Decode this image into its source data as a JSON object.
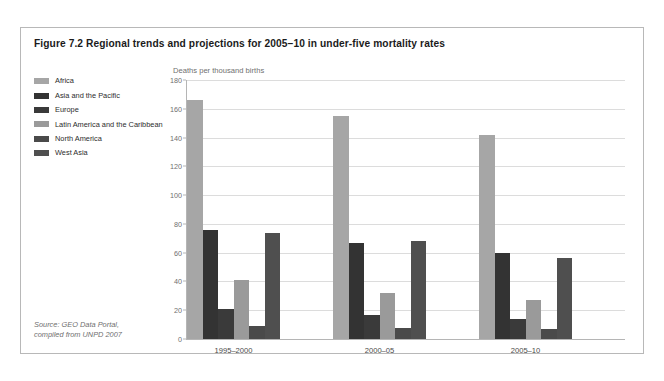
{
  "figure": {
    "title": "Figure 7.2 Regional trends and projections for 2005–10 in under-five mortality rates",
    "source_note": "Source: GEO Data Portal,\ncompiled from UNPD 2007"
  },
  "legend": {
    "items": [
      {
        "label": "Africa",
        "color": "#a6a6a6"
      },
      {
        "label": "Asia and the Pacific",
        "color": "#333333"
      },
      {
        "label": "Europe",
        "color": "#3a3a3a"
      },
      {
        "label": "Latin America and the Caribbean",
        "color": "#9a9a9a"
      },
      {
        "label": "North America",
        "color": "#4a4a4a"
      },
      {
        "label": "West Asia",
        "color": "#4f4f4f"
      }
    ]
  },
  "chart_data": {
    "type": "bar",
    "title": "Figure 7.2 Regional trends and projections for 2005–10 in under-five mortality rates",
    "xlabel": "",
    "ylabel": "Deaths per thousand births",
    "ylim": [
      0,
      180
    ],
    "yticks": [
      0,
      20,
      40,
      60,
      80,
      100,
      120,
      140,
      160,
      180
    ],
    "grid": true,
    "legend_position": "left",
    "categories": [
      "1995–2000",
      "2000–05",
      "2005–10"
    ],
    "series": [
      {
        "name": "Africa",
        "color": "#a6a6a6",
        "values": [
          166,
          155,
          142
        ]
      },
      {
        "name": "Asia and the Pacific",
        "color": "#333333",
        "values": [
          76,
          67,
          60
        ]
      },
      {
        "name": "Europe",
        "color": "#3a3a3a",
        "values": [
          21,
          17,
          14
        ]
      },
      {
        "name": "Latin America and the Caribbean",
        "color": "#9a9a9a",
        "values": [
          41,
          32,
          27
        ]
      },
      {
        "name": "North America",
        "color": "#4a4a4a",
        "values": [
          9,
          8,
          7
        ]
      },
      {
        "name": "West Asia",
        "color": "#4f4f4f",
        "values": [
          74,
          68,
          56
        ]
      }
    ]
  }
}
